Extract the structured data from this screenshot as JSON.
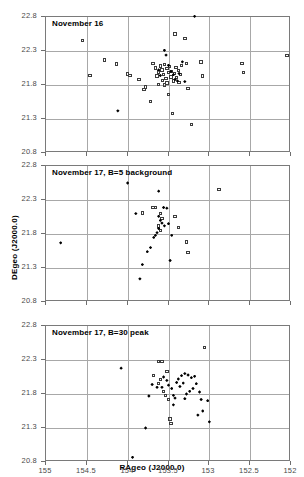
{
  "figure": {
    "axis_x_title": "RAgeo (J2000.0)",
    "axis_y_title": "DEgeo (J2000.0)",
    "x_ticks": [
      "155",
      "154.5",
      "154",
      "153.5",
      "153",
      "152.5",
      "152"
    ],
    "y_ticks": [
      "22.8",
      "22.3",
      "21.8",
      "21.3",
      "20.8"
    ]
  },
  "chart_data": [
    {
      "type": "scatter",
      "title": "November 16",
      "xlabel": "RAgeo (J2000.0)",
      "ylabel": "DEgeo (J2000.0)",
      "xlim": [
        155.0,
        152.0
      ],
      "ylim": [
        20.8,
        22.8
      ],
      "x_inverted": true,
      "grid": true,
      "legend": "none",
      "series": [
        {
          "name": "open-square",
          "marker": "open square",
          "points": [
            [
              154.55,
              22.45
            ],
            [
              154.28,
              22.17
            ],
            [
              154.14,
              22.11
            ],
            [
              154.46,
              21.94
            ],
            [
              154.0,
              21.96
            ],
            [
              153.97,
              21.94
            ],
            [
              153.86,
              21.88
            ],
            [
              153.78,
              21.77
            ],
            [
              153.8,
              21.73
            ],
            [
              153.72,
              21.56
            ],
            [
              153.66,
              22.05
            ],
            [
              153.69,
              22.12
            ],
            [
              153.64,
              21.93
            ],
            [
              153.62,
              21.99
            ],
            [
              153.6,
              22.08
            ],
            [
              153.58,
              22.02
            ],
            [
              153.56,
              21.95
            ],
            [
              153.55,
              22.1
            ],
            [
              153.53,
              21.9
            ],
            [
              153.52,
              22.04
            ],
            [
              153.5,
              21.98
            ],
            [
              153.49,
              22.07
            ],
            [
              153.47,
              21.92
            ],
            [
              153.46,
              22.0
            ],
            [
              153.44,
              21.86
            ],
            [
              153.43,
              21.97
            ],
            [
              153.41,
              22.06
            ],
            [
              153.4,
              21.91
            ],
            [
              153.38,
              22.01
            ],
            [
              153.37,
              21.84
            ],
            [
              153.35,
              21.95
            ],
            [
              153.34,
              22.09
            ],
            [
              153.55,
              21.8
            ],
            [
              153.5,
              21.66
            ],
            [
              153.45,
              21.38
            ],
            [
              153.42,
              22.55
            ],
            [
              153.3,
              22.48
            ],
            [
              153.28,
              22.12
            ],
            [
              153.26,
              21.75
            ],
            [
              153.22,
              21.22
            ],
            [
              153.1,
              22.14
            ],
            [
              153.08,
              21.93
            ],
            [
              152.6,
              22.12
            ],
            [
              152.58,
              21.98
            ],
            [
              152.05,
              22.23
            ],
            [
              153.62,
              21.81
            ],
            [
              153.57,
              21.87
            ],
            [
              153.52,
              21.83
            ]
          ]
        },
        {
          "name": "filled-diamond",
          "marker": "filled diamond",
          "points": [
            [
              153.18,
              22.81
            ],
            [
              153.55,
              22.31
            ],
            [
              153.53,
              22.24
            ],
            [
              153.5,
              22.09
            ],
            [
              153.47,
              22.0
            ],
            [
              153.44,
              21.95
            ],
            [
              153.42,
              21.88
            ],
            [
              153.39,
              21.86
            ],
            [
              153.37,
              21.97
            ],
            [
              153.6,
              21.94
            ],
            [
              153.62,
              22.02
            ],
            [
              153.3,
              21.85
            ],
            [
              153.33,
              22.14
            ],
            [
              154.12,
              21.42
            ]
          ]
        }
      ]
    },
    {
      "type": "scatter",
      "title": "November 17, B=5 background",
      "xlabel": "RAgeo (J2000.0)",
      "ylabel": "DEgeo (J2000.0)",
      "xlim": [
        155.0,
        152.0
      ],
      "ylim": [
        20.8,
        22.8
      ],
      "x_inverted": true,
      "grid": true,
      "legend": "none",
      "series": [
        {
          "name": "open-square",
          "marker": "open square",
          "points": [
            [
              153.69,
              22.19
            ],
            [
              153.66,
              22.19
            ],
            [
              153.6,
              22.1
            ],
            [
              153.58,
              22.03
            ],
            [
              153.62,
              21.92
            ],
            [
              153.6,
              21.85
            ],
            [
              153.82,
              22.11
            ],
            [
              153.42,
              22.06
            ],
            [
              153.38,
              21.9
            ],
            [
              153.28,
              21.68
            ],
            [
              153.26,
              21.53
            ],
            [
              152.88,
              22.45
            ]
          ]
        },
        {
          "name": "filled-diamond",
          "marker": "filled diamond",
          "points": [
            [
              154.0,
              22.55
            ],
            [
              153.62,
              22.43
            ],
            [
              153.56,
              22.19
            ],
            [
              153.62,
              22.06
            ],
            [
              153.6,
              22.0
            ],
            [
              153.58,
              21.96
            ],
            [
              153.55,
              21.92
            ],
            [
              153.62,
              21.88
            ],
            [
              153.64,
              21.82
            ],
            [
              153.66,
              21.78
            ],
            [
              153.68,
              21.75
            ],
            [
              153.72,
              21.6
            ],
            [
              153.76,
              21.54
            ],
            [
              153.82,
              21.35
            ],
            [
              153.85,
              21.14
            ],
            [
              153.9,
              22.1
            ],
            [
              153.52,
              22.18
            ],
            [
              153.5,
              21.95
            ],
            [
              153.46,
              21.78
            ],
            [
              153.48,
              21.41
            ],
            [
              154.82,
              21.67
            ]
          ]
        }
      ]
    },
    {
      "type": "scatter",
      "title": "November 17, B=30 peak",
      "xlabel": "RAgeo (J2000.0)",
      "ylabel": "DEgeo (J2000.0)",
      "xlim": [
        155.0,
        152.0
      ],
      "ylim": [
        20.8,
        22.8
      ],
      "x_inverted": true,
      "grid": true,
      "legend": "none",
      "series": [
        {
          "name": "open-square",
          "marker": "open square",
          "points": [
            [
              153.06,
              22.48
            ],
            [
              153.62,
              22.28
            ],
            [
              153.58,
              22.28
            ],
            [
              153.52,
              22.13
            ],
            [
              153.68,
              22.07
            ],
            [
              153.6,
              22.01
            ],
            [
              153.62,
              21.95
            ],
            [
              153.56,
              21.84
            ],
            [
              153.54,
              21.78
            ],
            [
              153.5,
              21.72
            ],
            [
              153.48,
              21.43
            ],
            [
              153.47,
              21.37
            ]
          ]
        },
        {
          "name": "filled-diamond",
          "marker": "filled diamond",
          "points": [
            [
              154.08,
              22.18
            ],
            [
              153.56,
              22.05
            ],
            [
              153.52,
              22.0
            ],
            [
              153.5,
              21.93
            ],
            [
              153.46,
              21.88
            ],
            [
              153.44,
              21.78
            ],
            [
              153.42,
              21.74
            ],
            [
              153.38,
              22.02
            ],
            [
              153.34,
              22.07
            ],
            [
              153.3,
              22.1
            ],
            [
              153.26,
              22.08
            ],
            [
              153.22,
              22.04
            ],
            [
              153.18,
              22.06
            ],
            [
              153.16,
              21.95
            ],
            [
              153.2,
              21.88
            ],
            [
              153.24,
              21.84
            ],
            [
              153.28,
              21.8
            ],
            [
              153.3,
              21.73
            ],
            [
              153.12,
              21.83
            ],
            [
              153.1,
              21.72
            ],
            [
              153.08,
              21.55
            ],
            [
              153.02,
              21.7
            ],
            [
              153.0,
              21.39
            ],
            [
              153.14,
              21.49
            ],
            [
              153.36,
              21.91
            ],
            [
              153.32,
              21.96
            ],
            [
              153.4,
              21.97
            ],
            [
              153.44,
              21.64
            ],
            [
              153.58,
              21.9
            ],
            [
              153.64,
              21.9
            ],
            [
              153.7,
              21.94
            ],
            [
              153.74,
              21.77
            ],
            [
              153.78,
              21.3
            ],
            [
              153.94,
              20.87
            ]
          ]
        }
      ]
    }
  ]
}
